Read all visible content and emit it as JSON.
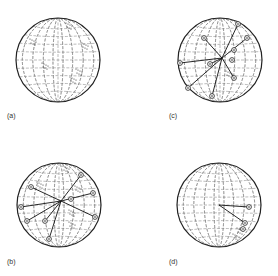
{
  "figure": {
    "panels": [
      {
        "id": "a",
        "label": "(a)",
        "cx": 58,
        "cy": 60,
        "r": 42,
        "label_x": 7,
        "label_y": 112,
        "lines": [],
        "markers": [],
        "clusters": [
          [
            -24,
            -18
          ],
          [
            12,
            -34
          ],
          [
            28,
            -14
          ],
          [
            -12,
            6
          ],
          [
            16,
            20
          ],
          [
            22,
            12
          ]
        ]
      },
      {
        "id": "c",
        "label": "(c)",
        "cx": 220,
        "cy": 60,
        "r": 42,
        "label_x": 169,
        "label_y": 112,
        "lines": [
          [
            [
              -40,
              3
            ],
            [
              2,
              -2
            ]
          ],
          [
            [
              2,
              -2
            ],
            [
              18,
              -36
            ]
          ],
          [
            [
              2,
              -2
            ],
            [
              27,
              -22
            ]
          ],
          [
            [
              2,
              -2
            ],
            [
              -16,
              -22
            ]
          ],
          [
            [
              2,
              -2
            ],
            [
              14,
              18
            ]
          ],
          [
            [
              2,
              -2
            ],
            [
              -32,
              28
            ]
          ],
          [
            [
              2,
              -2
            ],
            [
              -8,
              36
            ]
          ],
          [
            [
              2,
              -2
            ],
            [
              -10,
              4
            ]
          ]
        ],
        "markers": [
          [
            -40,
            3
          ],
          [
            18,
            -36
          ],
          [
            27,
            -22
          ],
          [
            -16,
            -22
          ],
          [
            14,
            18
          ],
          [
            -32,
            28
          ],
          [
            -8,
            36
          ],
          [
            -10,
            4
          ],
          [
            14,
            -10
          ],
          [
            12,
            0
          ]
        ],
        "clusters": [
          [
            10,
            14
          ]
        ]
      },
      {
        "id": "b",
        "label": "(b)",
        "cx": 59,
        "cy": 205,
        "r": 42,
        "label_x": 7,
        "label_y": 258,
        "lines": [
          [
            [
              -38,
              2
            ],
            [
              2,
              -4
            ]
          ],
          [
            [
              2,
              -4
            ],
            [
              22,
              -30
            ]
          ],
          [
            [
              2,
              -4
            ],
            [
              34,
              -12
            ]
          ],
          [
            [
              2,
              -4
            ],
            [
              -28,
              -18
            ]
          ],
          [
            [
              2,
              -4
            ],
            [
              36,
              12
            ]
          ],
          [
            [
              2,
              -4
            ],
            [
              -32,
              16
            ]
          ],
          [
            [
              2,
              -4
            ],
            [
              -14,
              16
            ]
          ],
          [
            [
              2,
              -4
            ],
            [
              -10,
              34
            ]
          ]
        ],
        "markers": [
          [
            -38,
            2
          ],
          [
            22,
            -30
          ],
          [
            34,
            -12
          ],
          [
            -28,
            -18
          ],
          [
            36,
            12
          ],
          [
            -32,
            16
          ],
          [
            -14,
            16
          ],
          [
            -10,
            34
          ],
          [
            12,
            -6
          ]
        ],
        "clusters": [
          [
            -18,
            -20
          ],
          [
            8,
            -36
          ],
          [
            20,
            -16
          ],
          [
            14,
            8
          ],
          [
            14,
            20
          ]
        ]
      },
      {
        "id": "d",
        "label": "(d)",
        "cx": 219,
        "cy": 205,
        "r": 42,
        "label_x": 169,
        "label_y": 258,
        "lines": [
          [
            [
              0,
              0
            ],
            [
              30,
              2
            ]
          ],
          [
            [
              0,
              0
            ],
            [
              26,
              18
            ]
          ]
        ],
        "markers": [
          [
            30,
            2
          ],
          [
            26,
            18
          ],
          [
            24,
            24
          ]
        ],
        "clusters": [
          [
            22,
            26
          ],
          [
            18,
            32
          ]
        ]
      }
    ]
  }
}
